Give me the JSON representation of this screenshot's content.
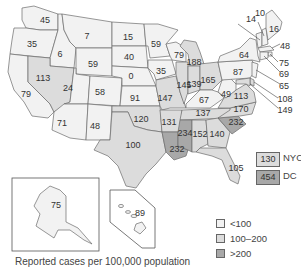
{
  "colors": {
    "low": "#f2f2f2",
    "mid": "#dcdcdc",
    "high": "#a8a8a8",
    "border": "#6b6b6b"
  },
  "states": {
    "WA": {
      "value": "45",
      "class": "low"
    },
    "OR": {
      "value": "35",
      "class": "low"
    },
    "CA": {
      "value": "79",
      "class": "low"
    },
    "ID": {
      "value": "6",
      "class": "low"
    },
    "NV": {
      "value": "113",
      "class": "mid"
    },
    "MT": {
      "value": "7",
      "class": "low"
    },
    "WY": {
      "value": "59",
      "class": "low"
    },
    "UT": {
      "value": "24",
      "class": "low"
    },
    "AZ": {
      "value": "71",
      "class": "low"
    },
    "CO": {
      "value": "58",
      "class": "low"
    },
    "NM": {
      "value": "48",
      "class": "low"
    },
    "ND": {
      "value": "15",
      "class": "low"
    },
    "SD": {
      "value": "40",
      "class": "low"
    },
    "NE": {
      "value": "0",
      "class": "low"
    },
    "KS": {
      "value": "91",
      "class": "low"
    },
    "OK": {
      "value": "120",
      "class": "mid"
    },
    "TX": {
      "value": "100",
      "class": "mid"
    },
    "MN": {
      "value": "59",
      "class": "low"
    },
    "IA": {
      "value": "35",
      "class": "low"
    },
    "MO": {
      "value": "147",
      "class": "mid"
    },
    "AR": {
      "value": "131",
      "class": "mid"
    },
    "LA": {
      "value": "232",
      "class": "high"
    },
    "WI": {
      "value": "79",
      "class": "low"
    },
    "IL": {
      "value": "145",
      "class": "mid"
    },
    "MI": {
      "value": "188",
      "class": "mid"
    },
    "IN": {
      "value": "139",
      "class": "mid"
    },
    "OH": {
      "value": "165",
      "class": "mid"
    },
    "KY": {
      "value": "67",
      "class": "low"
    },
    "TN": {
      "value": "137",
      "class": "mid"
    },
    "MS": {
      "value": "234",
      "class": "high"
    },
    "AL": {
      "value": "152",
      "class": "mid"
    },
    "GA": {
      "value": "140",
      "class": "mid"
    },
    "FL": {
      "value": "105",
      "class": "mid"
    },
    "SC": {
      "value": "232",
      "class": "high"
    },
    "NC": {
      "value": "170",
      "class": "mid"
    },
    "VA": {
      "value": "113",
      "class": "mid"
    },
    "WV": {
      "value": "49",
      "class": "low"
    },
    "PA": {
      "value": "87",
      "class": "low"
    },
    "NY": {
      "value": "64",
      "class": "low"
    },
    "VT": {
      "value": "14",
      "class": "low"
    },
    "NH": {
      "value": "10",
      "class": "low"
    },
    "ME": {
      "value": "16",
      "class": "low"
    },
    "MA": {
      "value": "48",
      "class": "low"
    },
    "RI": {
      "value": "75",
      "class": "low"
    },
    "CT": {
      "value": "69",
      "class": "low"
    },
    "NJ": {
      "value": "65",
      "class": "low"
    },
    "DE": {
      "value": "108",
      "class": "mid"
    },
    "MD": {
      "value": "149",
      "class": "mid"
    },
    "AK": {
      "value": "75",
      "class": "low"
    },
    "HI": {
      "value": "89",
      "class": "low"
    }
  },
  "callouts": {
    "nyc": {
      "value": "130",
      "label": "NYC",
      "class": "mid"
    },
    "dc": {
      "value": "454",
      "label": "DC",
      "class": "high"
    }
  },
  "legend": [
    {
      "label": "<100",
      "class": "low"
    },
    {
      "label": "100–200",
      "class": "mid"
    },
    {
      "label": ">200",
      "class": "high"
    }
  ],
  "caption": "Reported cases per 100,000 population"
}
